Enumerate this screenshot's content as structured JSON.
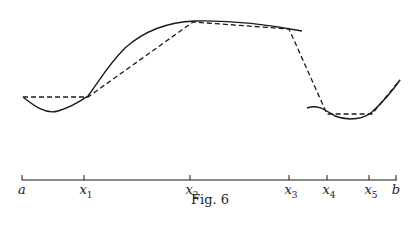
{
  "figure": {
    "caption": "Fig. 6",
    "axis_labels": [
      {
        "id": "a",
        "text": "a",
        "sub": "",
        "x": 22
      },
      {
        "id": "x1",
        "text": "x",
        "sub": "1",
        "x": 84
      },
      {
        "id": "x2",
        "text": "x",
        "sub": "2",
        "x": 190
      },
      {
        "id": "x3",
        "text": "x",
        "sub": "3",
        "x": 289
      },
      {
        "id": "x4",
        "text": "x",
        "sub": "4",
        "x": 327
      },
      {
        "id": "x5",
        "text": "x",
        "sub": "5",
        "x": 369
      },
      {
        "id": "b",
        "text": "b",
        "sub": "",
        "x": 396
      }
    ]
  }
}
